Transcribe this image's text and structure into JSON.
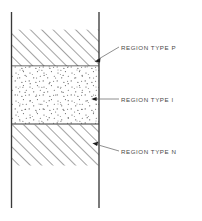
{
  "diagram": {
    "background_color": "#ffffff",
    "line_color": "#3a3a3a",
    "hatch_color": "#555555",
    "stipple_color": "#555555",
    "label_color": "#4a4a4a",
    "structure": {
      "left_edge_x": 11,
      "right_edge_x": 99,
      "top_y": 12,
      "bottom_y": 208
    },
    "regions": [
      {
        "id": "region-p",
        "label": "REGION TYPE P",
        "fill": "hatched",
        "hatch_direction": "forward-slash",
        "top_y": 29,
        "bottom_y": 66,
        "pointer_from_x": 119,
        "pointer_from_y": 47,
        "pointer_to_x": 95,
        "pointer_to_y": 61,
        "label_x": 121,
        "label_y": 48
      },
      {
        "id": "region-i",
        "label": "REGION TYPE I",
        "fill": "stippled",
        "hatch_direction": "none",
        "top_y": 66,
        "bottom_y": 124,
        "pointer_from_x": 119,
        "pointer_from_y": 99,
        "pointer_to_x": 92,
        "pointer_to_y": 99,
        "label_x": 121,
        "label_y": 100
      },
      {
        "id": "region-n",
        "label": "REGION TYPE N",
        "fill": "hatched",
        "hatch_direction": "forward-slash",
        "top_y": 124,
        "bottom_y": 166,
        "pointer_from_x": 119,
        "pointer_from_y": 152,
        "pointer_to_x": 93,
        "pointer_to_y": 143,
        "label_x": 121,
        "label_y": 152
      }
    ]
  }
}
